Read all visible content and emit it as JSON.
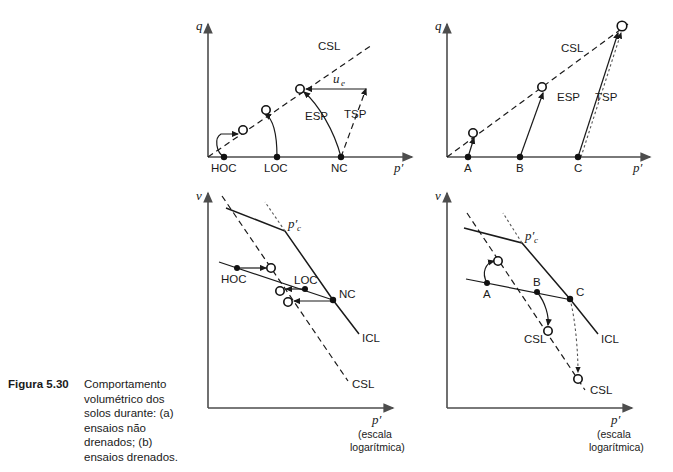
{
  "figure": {
    "caption_number": "Figura 5.30",
    "caption_text": "Comportamento volumétrico dos solos durante: (a) ensaios não drenados; (b) ensaios drenados."
  },
  "axes": {
    "q": "q",
    "v": "v",
    "p_prime": "p′",
    "log_scale_line1": "(escala",
    "log_scale_line2": "logarítmica)"
  },
  "panel_a_top": {
    "name": "q-p-plane-undrained",
    "y_axis_label": "q",
    "x_axis_label": "p′",
    "csl_label": "CSL",
    "esp_label": "ESP",
    "tsp_label": "TSP",
    "ue_label": "u",
    "ue_subscript": "e",
    "points": [
      {
        "label": "HOC",
        "x": 224,
        "y": 157
      },
      {
        "label": "LOC",
        "x": 277,
        "y": 157
      },
      {
        "label": "NC",
        "x": 341,
        "y": 157
      }
    ],
    "end_states": [
      {
        "x": 243,
        "y": 130
      },
      {
        "x": 266,
        "y": 110
      },
      {
        "x": 300,
        "y": 89
      }
    ]
  },
  "panel_b_top": {
    "name": "q-p-plane-drained",
    "y_axis_label": "q",
    "x_axis_label": "p′",
    "csl_label": "CSL",
    "esp_label": "ESP",
    "tsp_label": "TSP",
    "points": [
      {
        "label": "A",
        "x": 468,
        "y": 157
      },
      {
        "label": "B",
        "x": 520,
        "y": 157
      },
      {
        "label": "C",
        "x": 578,
        "y": 157
      }
    ],
    "end_states": [
      {
        "x": 473,
        "y": 133
      },
      {
        "x": 542,
        "y": 87
      },
      {
        "x": 622,
        "y": 25
      }
    ]
  },
  "panel_a_bottom": {
    "name": "v-logp-plane-undrained",
    "y_axis_label": "v",
    "x_axis_label": "p′",
    "pc_label": "p′",
    "pc_subscript": "c",
    "icl_label": "ICL",
    "csl_label": "CSL",
    "points": [
      {
        "label": "HOC",
        "x": 237,
        "y": 268
      },
      {
        "label": "LOC",
        "x": 305,
        "y": 289
      },
      {
        "label": "NC",
        "x": 333,
        "y": 300
      }
    ],
    "end_states": [
      {
        "x": 271,
        "y": 268
      },
      {
        "x": 280,
        "y": 291
      },
      {
        "x": 288,
        "y": 302
      }
    ]
  },
  "panel_b_bottom": {
    "name": "v-logp-plane-drained",
    "y_axis_label": "v",
    "x_axis_label": "p′",
    "pc_label": "p′",
    "pc_subscript": "c",
    "icl_label": "ICL",
    "csl_label_upper": "CSL",
    "csl_label_lower": "CSL",
    "points": [
      {
        "label": "A",
        "x": 487,
        "y": 283
      },
      {
        "label": "B",
        "x": 537,
        "y": 292
      },
      {
        "label": "C",
        "x": 570,
        "y": 299
      }
    ],
    "end_states": [
      {
        "x": 498,
        "y": 261
      },
      {
        "x": 548,
        "y": 331
      },
      {
        "x": 578,
        "y": 379
      }
    ]
  },
  "colors": {
    "ink": "#1a1a1a",
    "axis": "#4d4d4d",
    "background": "#ffffff"
  }
}
